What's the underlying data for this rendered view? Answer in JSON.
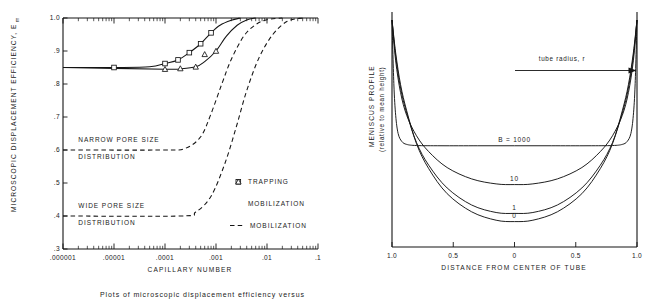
{
  "caption": "Plots of microscopic displacement efficiency versus",
  "chart_data": [
    {
      "type": "line",
      "id": "displacement-efficiency",
      "title": "",
      "xlabel": "CAPILLARY NUMBER",
      "ylabel": "MICROSCOPIC DISPLACEMENT EFFICIENCY, E",
      "ylabel_subscript": "m",
      "xscale": "log",
      "xlim": [
        1e-06,
        0.1
      ],
      "ylim": [
        0.3,
        1.0
      ],
      "grid": false,
      "xticks": [
        ".000001",
        ".00001",
        ".0001",
        ".001",
        ".01",
        ".1"
      ],
      "xtick_values": [
        1e-06,
        1e-05,
        0.0001,
        0.001,
        0.01,
        0.1
      ],
      "yticks": [
        ".3",
        ".4",
        ".5",
        ".6",
        ".7",
        ".8",
        ".9",
        "1.0"
      ],
      "ytick_values": [
        0.3,
        0.4,
        0.5,
        0.6,
        0.7,
        0.8,
        0.9,
        1.0
      ],
      "annotations": [
        {
          "text": "NARROW PORE SIZE",
          "x": 2e-06,
          "y": 0.625
        },
        {
          "text": "DISTRIBUTION",
          "x": 2e-06,
          "y": 0.572
        },
        {
          "text": "WIDE PORE SIZE",
          "x": 2e-06,
          "y": 0.425
        },
        {
          "text": "DISTRIBUTION",
          "x": 2e-06,
          "y": 0.372
        }
      ],
      "legend_position": "center-right",
      "legend": [
        {
          "label": "TRAPPING",
          "marker": "square",
          "style": "solid"
        },
        {
          "label": "MOBILIZATION",
          "marker": "triangle",
          "style": "solid"
        },
        {
          "label": "MOBILIZATION",
          "marker": "none",
          "style": "dashed"
        }
      ],
      "series": [
        {
          "name": "TRAPPING",
          "marker": "square",
          "style": "solid",
          "plateau": 0.85,
          "x": [
            1e-06,
            1e-05,
            5e-05,
            0.0001,
            0.00018,
            0.0003,
            0.0005,
            0.0008,
            0.0012,
            0.002,
            0.003
          ],
          "y": [
            0.85,
            0.85,
            0.852,
            0.862,
            0.873,
            0.895,
            0.922,
            0.955,
            0.978,
            0.993,
            1.0
          ],
          "marker_points": [
            {
              "x": 1e-05,
              "y": 0.85
            },
            {
              "x": 0.0001,
              "y": 0.862
            },
            {
              "x": 0.00018,
              "y": 0.873
            },
            {
              "x": 0.0003,
              "y": 0.895
            },
            {
              "x": 0.0005,
              "y": 0.922
            },
            {
              "x": 0.0008,
              "y": 0.955
            }
          ]
        },
        {
          "name": "MOBILIZATION",
          "marker": "triangle",
          "style": "solid",
          "plateau": 0.85,
          "x": [
            1e-06,
            0.0001,
            0.0002,
            0.0004,
            0.0006,
            0.001,
            0.0016,
            0.0026,
            0.004,
            0.006
          ],
          "y": [
            0.85,
            0.845,
            0.846,
            0.852,
            0.868,
            0.9,
            0.945,
            0.978,
            0.994,
            1.0
          ],
          "marker_points": [
            {
              "x": 0.0001,
              "y": 0.845
            },
            {
              "x": 0.0002,
              "y": 0.847
            },
            {
              "x": 0.0004,
              "y": 0.852
            },
            {
              "x": 0.0006,
              "y": 0.89
            },
            {
              "x": 0.001,
              "y": 0.9
            }
          ]
        },
        {
          "name": "MOBILIZATION NARROW",
          "marker": "none",
          "style": "dashed",
          "plateau": 0.6,
          "x": [
            1e-06,
            0.0001,
            0.00025,
            0.0005,
            0.0008,
            0.0013,
            0.002,
            0.0035,
            0.006,
            0.01,
            0.02
          ],
          "y": [
            0.6,
            0.6,
            0.605,
            0.64,
            0.71,
            0.8,
            0.875,
            0.945,
            0.98,
            0.995,
            1.0
          ]
        },
        {
          "name": "MOBILIZATION WIDE",
          "marker": "none",
          "style": "dashed",
          "plateau": 0.4,
          "x": [
            1e-06,
            0.0002,
            0.0004,
            0.0008,
            0.0015,
            0.0025,
            0.004,
            0.007,
            0.013,
            0.025,
            0.05
          ],
          "y": [
            0.4,
            0.4,
            0.412,
            0.46,
            0.56,
            0.67,
            0.78,
            0.88,
            0.95,
            0.99,
            1.0
          ]
        }
      ]
    },
    {
      "type": "line",
      "id": "meniscus-profile",
      "title": "",
      "xlabel": "DISTANCE FROM CENTER OF TUBE",
      "ylabel_line1": "MENISCUS  PROFILE",
      "ylabel_line2": "(relative to mean height)",
      "xlim": [
        -1.0,
        1.0
      ],
      "ylim": [
        0,
        1
      ],
      "grid": false,
      "xticks": [
        "1.0",
        "0.5",
        "0",
        "0.5",
        "1.0"
      ],
      "xtick_values": [
        -1.0,
        -0.5,
        0,
        0.5,
        1.0
      ],
      "annotations": [
        {
          "text": "tube radius, r",
          "type": "arrow-label"
        }
      ],
      "curve_labels": [
        {
          "label": "B = 1000",
          "x": 0.0
        },
        {
          "label": "10",
          "x": 0.0
        },
        {
          "label": "1",
          "x": 0.0
        },
        {
          "label": "0",
          "x": 0.0
        }
      ],
      "series": [
        {
          "name": "B = 1000",
          "bond_number": 1000,
          "center_depth": 0.0,
          "x": [
            -1.0,
            -0.985,
            -0.97,
            -0.95,
            -0.92,
            -0.88,
            -0.8,
            -0.6,
            -0.3,
            0.0,
            0.3,
            0.6,
            0.8,
            0.88,
            0.92,
            0.95,
            0.97,
            0.985,
            1.0
          ],
          "y": [
            1.0,
            0.72,
            0.58,
            0.5,
            0.465,
            0.452,
            0.447,
            0.446,
            0.446,
            0.446,
            0.446,
            0.446,
            0.447,
            0.452,
            0.465,
            0.5,
            0.58,
            0.72,
            1.0
          ]
        },
        {
          "name": "10",
          "bond_number": 10,
          "center_depth": 0.21,
          "x": [
            -1.0,
            -0.97,
            -0.93,
            -0.88,
            -0.8,
            -0.7,
            -0.55,
            -0.35,
            -0.15,
            0.0,
            0.15,
            0.35,
            0.55,
            0.7,
            0.8,
            0.88,
            0.93,
            0.97,
            1.0
          ],
          "y": [
            1.0,
            0.82,
            0.68,
            0.58,
            0.49,
            0.42,
            0.35,
            0.3,
            0.278,
            0.275,
            0.278,
            0.3,
            0.35,
            0.42,
            0.49,
            0.58,
            0.68,
            0.82,
            1.0
          ]
        },
        {
          "name": "1",
          "bond_number": 1,
          "center_depth": 0.36,
          "x": [
            -1.0,
            -0.97,
            -0.93,
            -0.88,
            -0.8,
            -0.7,
            -0.55,
            -0.35,
            -0.15,
            0.0,
            0.15,
            0.35,
            0.55,
            0.7,
            0.8,
            0.88,
            0.93,
            0.97,
            1.0
          ],
          "y": [
            1.0,
            0.84,
            0.7,
            0.59,
            0.46,
            0.36,
            0.26,
            0.185,
            0.152,
            0.148,
            0.152,
            0.185,
            0.26,
            0.36,
            0.46,
            0.59,
            0.7,
            0.84,
            1.0
          ]
        },
        {
          "name": "0",
          "bond_number": 0,
          "center_depth": 0.4,
          "x": [
            -1.0,
            -0.97,
            -0.93,
            -0.88,
            -0.8,
            -0.7,
            -0.55,
            -0.35,
            -0.15,
            0.0,
            0.15,
            0.35,
            0.55,
            0.7,
            0.8,
            0.88,
            0.93,
            0.97,
            1.0
          ],
          "y": [
            1.0,
            0.855,
            0.715,
            0.6,
            0.455,
            0.345,
            0.235,
            0.155,
            0.118,
            0.112,
            0.118,
            0.155,
            0.235,
            0.345,
            0.455,
            0.6,
            0.715,
            0.855,
            1.0
          ]
        }
      ]
    }
  ]
}
